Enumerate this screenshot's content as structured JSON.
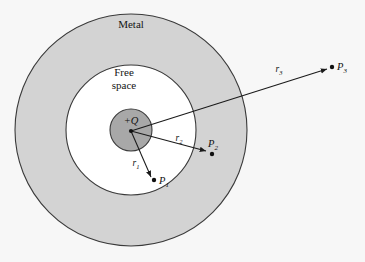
{
  "figure": {
    "background_color": "#f7f7f7",
    "width": 365,
    "height": 262
  },
  "regions": [
    {
      "name": "metal-shell",
      "label": "Metal",
      "fill_color": "#d3d3d3",
      "stroke_color": "#3a3a3a",
      "center_x": 131,
      "center_y": 130,
      "radius": 116,
      "label_x": 131,
      "label_y": 28
    },
    {
      "name": "free-space-cavity",
      "label_line1": "Free",
      "label_line2": "space",
      "fill_color": "#ffffff",
      "stroke_color": "#3a3a3a",
      "center_x": 131,
      "center_y": 130,
      "radius": 65,
      "label_x": 124,
      "label_y": 76
    },
    {
      "name": "charge-sphere",
      "label": "+Q",
      "fill_color": "#a8a8a8",
      "stroke_color": "#3a3a3a",
      "center_x": 131,
      "center_y": 130,
      "radius": 21,
      "label_x": 131,
      "label_y": 124
    }
  ],
  "origin": {
    "label": "charge-center",
    "x": 131,
    "y": 131
  },
  "vectors": [
    {
      "name": "r1",
      "symbol": "r",
      "subscript": "1",
      "label_x": 136,
      "label_y": 166,
      "x1": 131,
      "y1": 131,
      "x2": 151,
      "y2": 177,
      "point_name": "P1",
      "point_symbol": "P",
      "point_subscript": "1",
      "point_dot_x": 154,
      "point_dot_y": 180,
      "point_label_x": 159,
      "point_label_y": 184,
      "region": "free space"
    },
    {
      "name": "r2",
      "symbol": "r",
      "subscript": "2",
      "label_x": 179,
      "label_y": 141,
      "x1": 131,
      "y1": 131,
      "x2": 206,
      "y2": 151,
      "point_name": "P2",
      "point_symbol": "P",
      "point_subscript": "2",
      "point_dot_x": 212,
      "point_dot_y": 154,
      "point_label_x": 208,
      "point_label_y": 147,
      "region": "metal"
    },
    {
      "name": "r3",
      "symbol": "r",
      "subscript": "3",
      "label_x": 279,
      "label_y": 72,
      "x1": 131,
      "y1": 131,
      "x2": 327,
      "y2": 69,
      "point_name": "P3",
      "point_symbol": "P",
      "point_subscript": "3",
      "point_dot_x": 332,
      "point_dot_y": 67,
      "point_label_x": 337,
      "point_label_y": 70,
      "region": "outside"
    }
  ]
}
